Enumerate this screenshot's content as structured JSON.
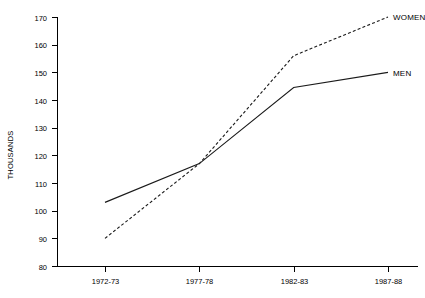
{
  "chart_data": {
    "type": "line",
    "title": "",
    "subtitle": "",
    "xlabel": "",
    "ylabel": "THOUSANDS",
    "categories": [
      "1972-73",
      "1977-78",
      "1982-83",
      "1987-88"
    ],
    "series": [
      {
        "name": "MEN",
        "style": "solid",
        "values": [
          103,
          117,
          144.5,
          150
        ]
      },
      {
        "name": "WOMEN",
        "style": "dashed",
        "values": [
          90,
          117,
          156,
          170
        ]
      }
    ],
    "ylim": [
      80,
      170
    ],
    "ytick_labels": [
      "170",
      "160",
      "150",
      "140",
      "130",
      "120",
      "110",
      "100",
      "90",
      "80"
    ],
    "ytick_values": [
      170,
      160,
      150,
      140,
      130,
      120,
      110,
      100,
      90,
      80
    ],
    "grid": false,
    "legend_position": "right-inline",
    "line_color": "#1a1a1a",
    "axis_color": "#000000"
  },
  "labels": {
    "y_axis_title": "THOUSANDS",
    "series_men": "MEN",
    "series_women": "WOMEN"
  }
}
